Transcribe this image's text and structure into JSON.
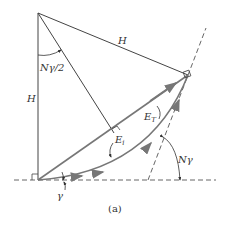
{
  "figure": {
    "caption": "(a)",
    "labels": {
      "h_vertical": "H",
      "h_slant": "H",
      "half_angle": "Nγ/2",
      "e_t": "E",
      "e_t_sub": "T",
      "e_i": "E",
      "e_i_sub": "i",
      "gamma": "γ",
      "n_gamma": "Nγ"
    },
    "colors": {
      "line": "#444444",
      "arrow": "#777777",
      "dash": "#555555"
    }
  }
}
